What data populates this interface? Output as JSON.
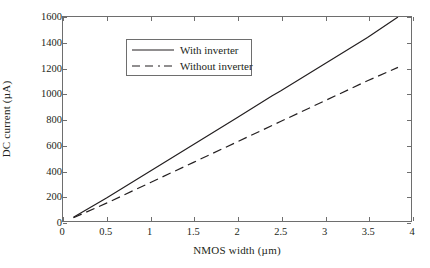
{
  "chart_data": {
    "type": "line",
    "title": "",
    "xlabel": "NMOS width (µm)",
    "ylabel": "DC current (µA)",
    "xlim": [
      0,
      4
    ],
    "ylim": [
      0,
      1600
    ],
    "xticks": [
      "0",
      "0.5",
      "1",
      "1.5",
      "2",
      "2.5",
      "3",
      "3.5",
      "4"
    ],
    "xtick_values": [
      0,
      0.5,
      1,
      1.5,
      2,
      2.5,
      3,
      3.5,
      4
    ],
    "yticks": [
      "0",
      "200",
      "400",
      "600",
      "800",
      "1000",
      "1200",
      "1400",
      "1600"
    ],
    "ytick_values": [
      0,
      200,
      400,
      600,
      800,
      1000,
      1200,
      1400,
      1600
    ],
    "grid": false,
    "legend_position": "upper left",
    "series": [
      {
        "name": "With inverter",
        "style": "solid",
        "color": "#231f20",
        "x": [
          0.12,
          0.5,
          1.0,
          1.5,
          2.0,
          2.4,
          2.5,
          3.0,
          3.5,
          3.85
        ],
        "values": [
          30,
          180,
          390,
          600,
          810,
          980,
          1020,
          1230,
          1440,
          1600
        ]
      },
      {
        "name": "Without inverter",
        "style": "dashed",
        "color": "#231f20",
        "x": [
          0.12,
          0.5,
          1.0,
          1.5,
          2.0,
          2.5,
          3.0,
          3.5,
          3.85
        ],
        "values": [
          25,
          140,
          300,
          460,
          620,
          780,
          940,
          1100,
          1205
        ]
      }
    ]
  },
  "legend": {
    "items": [
      {
        "label": "With inverter",
        "style": "solid"
      },
      {
        "label": "Without inverter",
        "style": "dashed"
      }
    ]
  },
  "axes": {
    "x_title": "NMOS width (µm)",
    "y_title": "DC current (µA)"
  }
}
